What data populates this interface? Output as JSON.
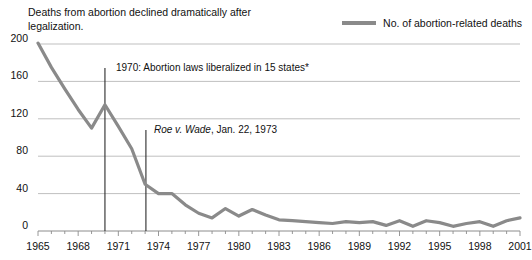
{
  "title": {
    "line1": "Deaths from abortion declined dramatically after",
    "line2": "legalization."
  },
  "legend": {
    "label": "No. of abortion-related deaths",
    "color": "#8a8a8a"
  },
  "annotations": [
    {
      "text": "1970: Abortion laws liberalized in 15 states*",
      "year": 1970
    },
    {
      "text_italic": "Roe v. Wade",
      "text_rest": ", Jan. 22, 1973",
      "year": 1973
    }
  ],
  "chart_data": {
    "type": "line",
    "title": "Deaths from abortion declined dramatically after legalization.",
    "xlabel": "",
    "ylabel": "",
    "xlim": [
      1965,
      2001
    ],
    "ylim": [
      0,
      200
    ],
    "yticks": [
      0,
      40,
      80,
      120,
      160,
      200
    ],
    "xticks": [
      1965,
      1968,
      1971,
      1974,
      1977,
      1980,
      1983,
      1986,
      1989,
      1992,
      1995,
      1998,
      2001
    ],
    "grid": true,
    "legend_position": "top-right",
    "series": [
      {
        "name": "No. of abortion-related deaths",
        "color": "#8a8a8a",
        "x": [
          1965,
          1966,
          1967,
          1968,
          1969,
          1970,
          1971,
          1972,
          1973,
          1974,
          1975,
          1976,
          1977,
          1978,
          1979,
          1980,
          1981,
          1982,
          1983,
          1984,
          1985,
          1986,
          1987,
          1988,
          1989,
          1990,
          1991,
          1992,
          1993,
          1994,
          1995,
          1996,
          1997,
          1998,
          1999,
          2000,
          2001
        ],
        "values": [
          201,
          175,
          152,
          130,
          110,
          135,
          112,
          88,
          50,
          40,
          40,
          28,
          19,
          14,
          24,
          16,
          23,
          17,
          12,
          11,
          10,
          9,
          8,
          10,
          9,
          10,
          6,
          11,
          5,
          11,
          9,
          5,
          8,
          10,
          5,
          11,
          14
        ]
      }
    ]
  },
  "axis": {
    "yticks": [
      "0",
      "40",
      "80",
      "120",
      "160",
      "200"
    ],
    "xticks": [
      "1965",
      "1968",
      "1971",
      "1974",
      "1977",
      "1980",
      "1983",
      "1986",
      "1989",
      "1992",
      "1995",
      "1998",
      "2001"
    ]
  }
}
